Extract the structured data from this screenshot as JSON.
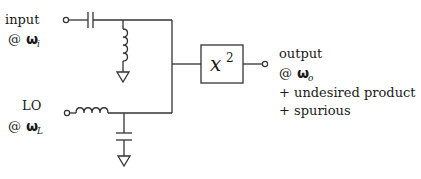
{
  "diagram": {
    "input": {
      "label": "input",
      "freq_prefix": "@ ",
      "omega": "ω",
      "subscript": "i"
    },
    "lo": {
      "label": "LO",
      "freq_prefix": "@ ",
      "omega": "ω",
      "subscript": "L"
    },
    "block": {
      "base": "x",
      "exponent": "2"
    },
    "output": {
      "label": "output",
      "freq_prefix": "@ ",
      "omega": "ω",
      "subscript": "o",
      "lines": [
        "+ undesired product",
        "+ spurious"
      ]
    },
    "components": [
      "input-terminal",
      "series-capacitor",
      "shunt-inductor",
      "ground",
      "lo-terminal",
      "series-inductor",
      "shunt-capacitor",
      "ground",
      "squarer-block",
      "output-terminal"
    ]
  }
}
